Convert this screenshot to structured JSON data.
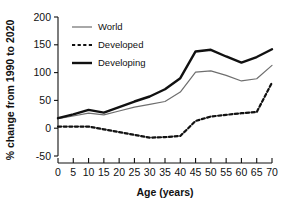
{
  "chart_data": {
    "type": "line",
    "title": "",
    "xlabel": "Age (years)",
    "ylabel": "% change from 1990 to 2020",
    "xlim": [
      0,
      70
    ],
    "ylim": [
      -50,
      200
    ],
    "xticks": [
      0,
      5,
      10,
      15,
      20,
      25,
      30,
      35,
      40,
      45,
      50,
      55,
      60,
      65,
      70
    ],
    "yticks": [
      -50,
      0,
      50,
      100,
      150,
      200
    ],
    "xtick_labels": [
      "0",
      "5",
      "10",
      "15",
      "20",
      "25",
      "30",
      "35",
      "40",
      "45",
      "50",
      "55",
      "60",
      "65",
      "70"
    ],
    "ytick_labels": [
      "-50",
      "0",
      "50",
      "100",
      "150",
      "200"
    ],
    "grid": false,
    "legend_position": "upper left",
    "x": [
      0,
      5,
      10,
      15,
      20,
      25,
      30,
      35,
      40,
      45,
      50,
      55,
      60,
      65,
      70
    ],
    "series": [
      {
        "name": "World",
        "style": "thin-solid",
        "color": "#6e6e6e",
        "width": 1.2,
        "values": [
          17,
          22,
          27,
          24,
          31,
          38,
          43,
          48,
          65,
          101,
          103,
          95,
          85,
          89,
          113
        ]
      },
      {
        "name": "Developed",
        "style": "dashed",
        "color": "#111111",
        "width": 2.2,
        "values": [
          3,
          3,
          3,
          -2,
          -7,
          -12,
          -17,
          -16,
          -14,
          13,
          21,
          24,
          27,
          29,
          82
        ]
      },
      {
        "name": "Developing",
        "style": "thick-solid",
        "color": "#111111",
        "width": 2.4,
        "values": [
          18,
          25,
          33,
          28,
          38,
          48,
          57,
          70,
          90,
          138,
          141,
          129,
          118,
          128,
          142
        ]
      }
    ]
  },
  "legend": {
    "items": [
      {
        "label": "World"
      },
      {
        "label": "Developed"
      },
      {
        "label": "Developing"
      }
    ]
  },
  "axes": {
    "x_title": "Age (years)",
    "y_title": "% change from 1990 to 2020"
  },
  "colors": {
    "axis": "#111111",
    "world": "#6e6e6e",
    "developed": "#111111",
    "developing": "#111111",
    "background": "#ffffff"
  }
}
